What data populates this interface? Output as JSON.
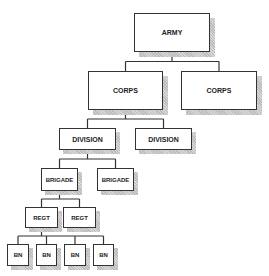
{
  "diagram": {
    "nodes": [
      {
        "id": "army",
        "label": "ARMY",
        "x": 134,
        "y": 13,
        "w": 76,
        "h": 39,
        "fs": 7
      },
      {
        "id": "corps1",
        "label": "CORPS",
        "x": 88,
        "y": 71,
        "w": 75,
        "h": 39,
        "fs": 7
      },
      {
        "id": "corps2",
        "label": "CORPS",
        "x": 181,
        "y": 71,
        "w": 76,
        "h": 39,
        "fs": 7
      },
      {
        "id": "div1",
        "label": "DIVISION",
        "x": 59,
        "y": 128,
        "w": 57,
        "h": 22,
        "fs": 7
      },
      {
        "id": "div2",
        "label": "DIVISION",
        "x": 135,
        "y": 128,
        "w": 57,
        "h": 22,
        "fs": 7
      },
      {
        "id": "brig1",
        "label": "BRIGADE",
        "x": 41,
        "y": 168,
        "w": 37,
        "h": 23,
        "fs": 6
      },
      {
        "id": "brig2",
        "label": "BRIGADE",
        "x": 97,
        "y": 168,
        "w": 37,
        "h": 23,
        "fs": 6
      },
      {
        "id": "regt1",
        "label": "REGT",
        "x": 25,
        "y": 207,
        "w": 33,
        "h": 21,
        "fs": 6
      },
      {
        "id": "regt2",
        "label": "REGT",
        "x": 63,
        "y": 207,
        "w": 33,
        "h": 21,
        "fs": 6
      },
      {
        "id": "bn1",
        "label": "BN",
        "x": 7,
        "y": 244,
        "w": 22,
        "h": 22,
        "fs": 6
      },
      {
        "id": "bn2",
        "label": "BN",
        "x": 36,
        "y": 244,
        "w": 21,
        "h": 22,
        "fs": 6
      },
      {
        "id": "bn3",
        "label": "BN",
        "x": 64,
        "y": 244,
        "w": 22,
        "h": 22,
        "fs": 6
      },
      {
        "id": "bn4",
        "label": "BN",
        "x": 93,
        "y": 244,
        "w": 21,
        "h": 22,
        "fs": 6
      }
    ],
    "edges": [
      [
        "army",
        "corps1"
      ],
      [
        "army",
        "corps2"
      ],
      [
        "corps1",
        "div1"
      ],
      [
        "corps1",
        "div2"
      ],
      [
        "div1",
        "brig1"
      ],
      [
        "div1",
        "brig2"
      ],
      [
        "brig1",
        "regt1"
      ],
      [
        "brig1",
        "regt2"
      ],
      [
        "regt1",
        "bn1"
      ],
      [
        "regt1",
        "bn2"
      ],
      [
        "regt1",
        "bn3"
      ],
      [
        "regt1",
        "bn4"
      ]
    ],
    "colors": {
      "line": "#333333",
      "shadow": "#c4c4c4"
    }
  }
}
